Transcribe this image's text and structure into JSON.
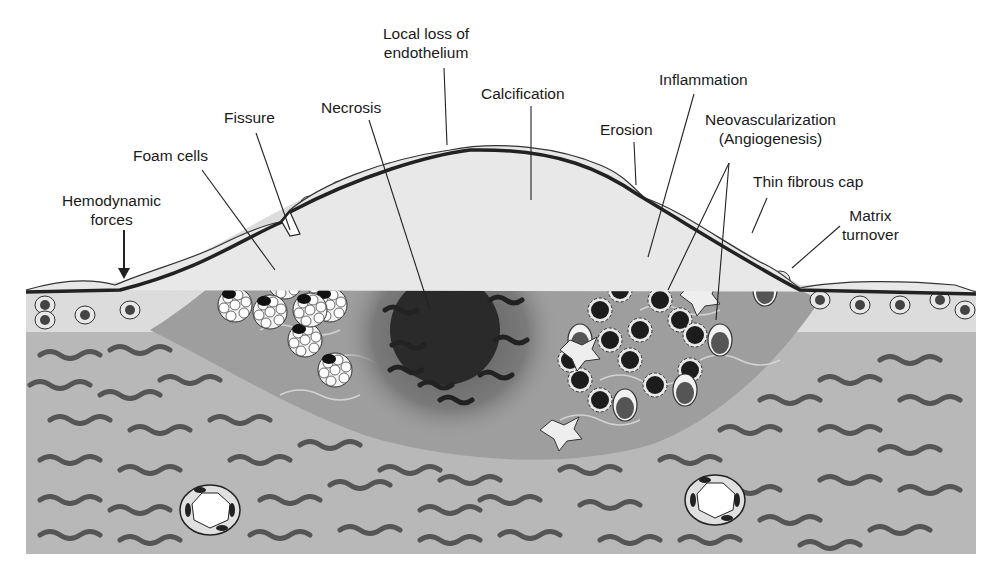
{
  "diagram": {
    "colors": {
      "background": "#ffffff",
      "media": "#b8b8b8",
      "intima_light": "#dcdcdc",
      "plaque_core": "#9e9e9e",
      "necrotic_core": "#2a2a2a",
      "collagen_fiber": "#555555",
      "endothelium_line": "#222222",
      "label_text": "#1a1a1a"
    },
    "labels": [
      {
        "id": "hemodynamic",
        "lines": [
          "Hemodynamic",
          "forces"
        ]
      },
      {
        "id": "foam",
        "lines": [
          "Foam cells"
        ]
      },
      {
        "id": "fissure",
        "lines": [
          "Fissure"
        ]
      },
      {
        "id": "necrosis",
        "lines": [
          "Necrosis"
        ]
      },
      {
        "id": "local_loss",
        "lines": [
          "Local loss of",
          "endothelium"
        ]
      },
      {
        "id": "calcification",
        "lines": [
          "Calcification"
        ]
      },
      {
        "id": "erosion",
        "lines": [
          "Erosion"
        ]
      },
      {
        "id": "inflammation",
        "lines": [
          "Inflammation"
        ]
      },
      {
        "id": "neovasc",
        "lines": [
          "Neovascularization",
          "(Angiogenesis)"
        ]
      },
      {
        "id": "thin_cap",
        "lines": [
          "Thin fibrous cap"
        ]
      },
      {
        "id": "matrix",
        "lines": [
          "Matrix",
          "turnover"
        ]
      }
    ]
  }
}
